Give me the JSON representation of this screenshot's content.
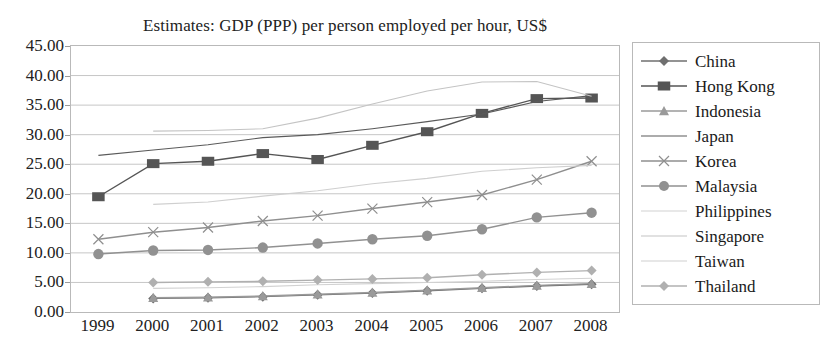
{
  "chart_data": {
    "type": "line",
    "title": "Estimates: GDP (PPP) per person employed per hour, US$",
    "xlabel": "",
    "ylabel": "",
    "x": [
      1999,
      2000,
      2001,
      2002,
      2003,
      2004,
      2005,
      2006,
      2007,
      2008
    ],
    "categories": [
      "1999",
      "2000",
      "2001",
      "2002",
      "2003",
      "2004",
      "2005",
      "2006",
      "2007",
      "2008"
    ],
    "ylim": [
      0,
      45
    ],
    "ytick_labels": [
      "0.00",
      "5.00",
      "10.00",
      "15.00",
      "20.00",
      "25.00",
      "30.00",
      "35.00",
      "40.00",
      "45.00"
    ],
    "ytick_values": [
      0,
      5,
      10,
      15,
      20,
      25,
      30,
      35,
      40,
      45
    ],
    "grid": true,
    "legend_position": "right",
    "series": [
      {
        "name": "China",
        "marker": "diamond",
        "color": "#6f6f6f",
        "values": [
          null,
          2.3,
          2.4,
          2.6,
          2.9,
          3.2,
          3.6,
          4.0,
          4.4,
          4.7
        ]
      },
      {
        "name": "Hong Kong",
        "marker": "square",
        "color": "#555555",
        "values": [
          19.5,
          25.1,
          25.5,
          26.8,
          25.8,
          28.2,
          30.5,
          33.6,
          36.1,
          36.2
        ]
      },
      {
        "name": "Indonesia",
        "marker": "triangle",
        "color": "#9a9a9a",
        "values": [
          null,
          2.4,
          2.5,
          2.7,
          3.0,
          3.3,
          3.7,
          4.1,
          4.5,
          4.8
        ]
      },
      {
        "name": "Japan",
        "marker": "none",
        "color": "#5a5a5a",
        "values": [
          26.5,
          27.4,
          28.3,
          29.5,
          30.0,
          31.0,
          32.2,
          33.5,
          35.6,
          36.6
        ]
      },
      {
        "name": "Korea",
        "marker": "x",
        "color": "#8f8f8f",
        "values": [
          12.3,
          13.5,
          14.3,
          15.4,
          16.3,
          17.5,
          18.6,
          19.8,
          22.4,
          25.5
        ]
      },
      {
        "name": "Malaysia",
        "marker": "circle",
        "color": "#919191",
        "values": [
          9.8,
          10.4,
          10.5,
          10.9,
          11.6,
          12.3,
          12.9,
          14.0,
          16.0,
          16.8
        ]
      },
      {
        "name": "Philippines",
        "marker": "none",
        "color": "#d2d2d2",
        "values": [
          null,
          4.0,
          4.1,
          4.3,
          4.6,
          4.8,
          5.0,
          5.2,
          5.5,
          5.7
        ]
      },
      {
        "name": "Singapore",
        "marker": "none",
        "color": "#c4c4c4",
        "values": [
          null,
          30.6,
          30.7,
          31.0,
          32.8,
          35.2,
          37.4,
          38.9,
          39.0,
          36.5
        ]
      },
      {
        "name": "Taiwan",
        "marker": "none",
        "color": "#cfcfcf",
        "values": [
          null,
          18.2,
          18.6,
          19.6,
          20.5,
          21.7,
          22.6,
          23.8,
          24.4,
          24.8
        ]
      },
      {
        "name": "Thailand",
        "marker": "diamond",
        "color": "#b0b0b0",
        "values": [
          null,
          5.0,
          5.1,
          5.2,
          5.4,
          5.6,
          5.8,
          6.3,
          6.7,
          7.0
        ]
      }
    ]
  }
}
